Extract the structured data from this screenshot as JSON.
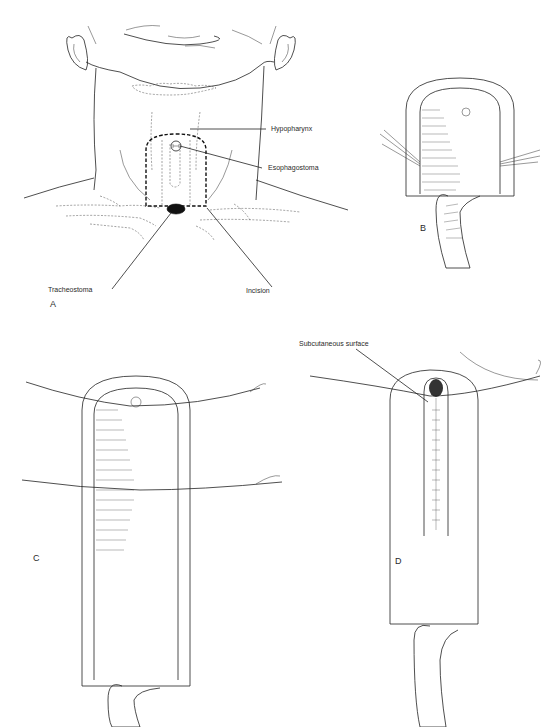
{
  "figure": {
    "panels": [
      {
        "id": "A",
        "letter": "A",
        "description": "Anterior neck with planned U-shaped incision around esophagostoma above tracheostoma"
      },
      {
        "id": "B",
        "letter": "B",
        "description": "Skin flap raised with traction sutures, tracheal tube below"
      },
      {
        "id": "C",
        "letter": "C",
        "description": "Sutures placed across flap to form tube"
      },
      {
        "id": "D",
        "letter": "D",
        "description": "Flap tubed with subcutaneous surface closure"
      }
    ],
    "labels": {
      "hypopharynx": "Hypopharynx",
      "esophagostoma": "Esophagostoma",
      "tracheostoma": "Tracheostoma",
      "incision": "Incision",
      "subcutaneous_surface": "Subcutaneous surface"
    },
    "colors": {
      "ink": "#222222",
      "background": "#ffffff"
    }
  }
}
